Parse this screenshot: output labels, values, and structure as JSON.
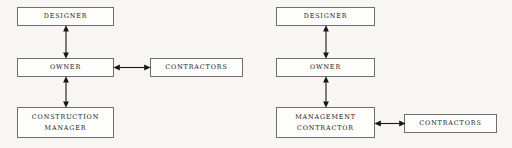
{
  "diagram": {
    "background_color": "#f7f6f3",
    "box_border_color": "#6e6e6e",
    "box_fill_color": "#fdfdfc",
    "arrow_color": "#181818",
    "panels": [
      {
        "id": "left",
        "name": "construction-manager-structure",
        "nodes": [
          {
            "id": "l-designer",
            "label": "Designer"
          },
          {
            "id": "l-owner",
            "label": "Owner"
          },
          {
            "id": "l-contractors",
            "label": "Contractors"
          },
          {
            "id": "l-cm",
            "label": "Construction\nManager"
          }
        ],
        "connectors": [
          {
            "id": "l-designer-owner",
            "from": "l-designer",
            "to": "l-owner",
            "orientation": "vertical",
            "arrowheads": "both"
          },
          {
            "id": "l-owner-cm",
            "from": "l-owner",
            "to": "l-cm",
            "orientation": "vertical",
            "arrowheads": "both"
          },
          {
            "id": "l-owner-contr",
            "from": "l-owner",
            "to": "l-contractors",
            "orientation": "horizontal",
            "arrowheads": "both"
          }
        ]
      },
      {
        "id": "right",
        "name": "management-contractor-structure",
        "nodes": [
          {
            "id": "r-designer",
            "label": "Designer"
          },
          {
            "id": "r-owner",
            "label": "Owner"
          },
          {
            "id": "r-mc",
            "label": "Management\nContractor"
          },
          {
            "id": "r-contractors",
            "label": "Contractors"
          }
        ],
        "connectors": [
          {
            "id": "r-designer-owner",
            "from": "r-designer",
            "to": "r-owner",
            "orientation": "vertical",
            "arrowheads": "both"
          },
          {
            "id": "r-owner-mc",
            "from": "r-owner",
            "to": "r-mc",
            "orientation": "vertical",
            "arrowheads": "both"
          },
          {
            "id": "r-mc-contr",
            "from": "r-mc",
            "to": "r-contractors",
            "orientation": "horizontal",
            "arrowheads": "both"
          }
        ]
      }
    ]
  }
}
